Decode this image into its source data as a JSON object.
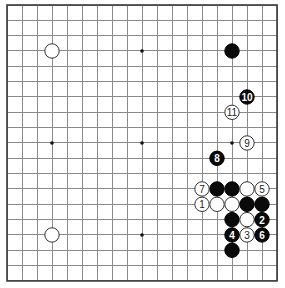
{
  "board": {
    "size": 19,
    "origin_x": 7,
    "origin_y": 5,
    "spacing_x": 15,
    "spacing_y": 15.33,
    "stone_radius": 7.2,
    "colors": {
      "background": "#ffffff",
      "grid": "#8a8a8a",
      "border": "#3a3a3a",
      "black_stone": "#0a0a0a",
      "white_stone": "#ffffff"
    }
  },
  "star_points": [
    [
      3,
      3
    ],
    [
      9,
      3
    ],
    [
      15,
      3
    ],
    [
      3,
      9
    ],
    [
      9,
      9
    ],
    [
      15,
      9
    ],
    [
      3,
      15
    ],
    [
      9,
      15
    ],
    [
      15,
      15
    ]
  ],
  "stones": [
    {
      "col": 3,
      "row": 3,
      "color": "white",
      "label": ""
    },
    {
      "col": 15,
      "row": 3,
      "color": "black",
      "label": ""
    },
    {
      "col": 3,
      "row": 15,
      "color": "white",
      "label": ""
    },
    {
      "col": 14,
      "row": 12,
      "color": "black",
      "label": ""
    },
    {
      "col": 15,
      "row": 12,
      "color": "black",
      "label": ""
    },
    {
      "col": 16,
      "row": 12,
      "color": "white",
      "label": ""
    },
    {
      "col": 14,
      "row": 13,
      "color": "white",
      "label": ""
    },
    {
      "col": 15,
      "row": 13,
      "color": "white",
      "label": ""
    },
    {
      "col": 16,
      "row": 13,
      "color": "black",
      "label": ""
    },
    {
      "col": 17,
      "row": 13,
      "color": "black",
      "label": ""
    },
    {
      "col": 15,
      "row": 14,
      "color": "black",
      "label": ""
    },
    {
      "col": 16,
      "row": 14,
      "color": "white",
      "label": ""
    },
    {
      "col": 15,
      "row": 16,
      "color": "black",
      "label": ""
    },
    {
      "col": 13,
      "row": 13,
      "color": "white",
      "label": "1"
    },
    {
      "col": 17,
      "row": 14,
      "color": "black",
      "label": "2"
    },
    {
      "col": 16,
      "row": 15,
      "color": "white",
      "label": "3"
    },
    {
      "col": 15,
      "row": 15,
      "color": "black",
      "label": "4"
    },
    {
      "col": 17,
      "row": 12,
      "color": "white",
      "label": "5"
    },
    {
      "col": 17,
      "row": 15,
      "color": "black",
      "label": "6"
    },
    {
      "col": 13,
      "row": 12,
      "color": "white",
      "label": "7"
    },
    {
      "col": 14,
      "row": 10,
      "color": "black",
      "label": "8"
    },
    {
      "col": 16,
      "row": 9,
      "color": "white",
      "label": "9"
    },
    {
      "col": 16,
      "row": 6,
      "color": "black",
      "label": "10"
    },
    {
      "col": 15,
      "row": 7,
      "color": "white",
      "label": "11"
    }
  ]
}
